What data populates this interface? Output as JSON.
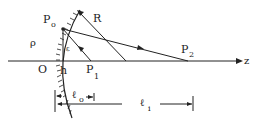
{
  "diagram": {
    "labels": {
      "p0": "P",
      "p0_sub": "o",
      "r": "R",
      "rho": "ρ",
      "epsilon": "ε",
      "origin": "O",
      "h": "h",
      "p1": "P",
      "p1_sub": "1",
      "p2": "P",
      "p2_sub": "2",
      "z": "z",
      "l0": "ℓ",
      "l0_sub": "o",
      "li": "ℓ",
      "li_sub": "i"
    },
    "colors": {
      "line": "#222222",
      "background": "#ffffff"
    }
  }
}
